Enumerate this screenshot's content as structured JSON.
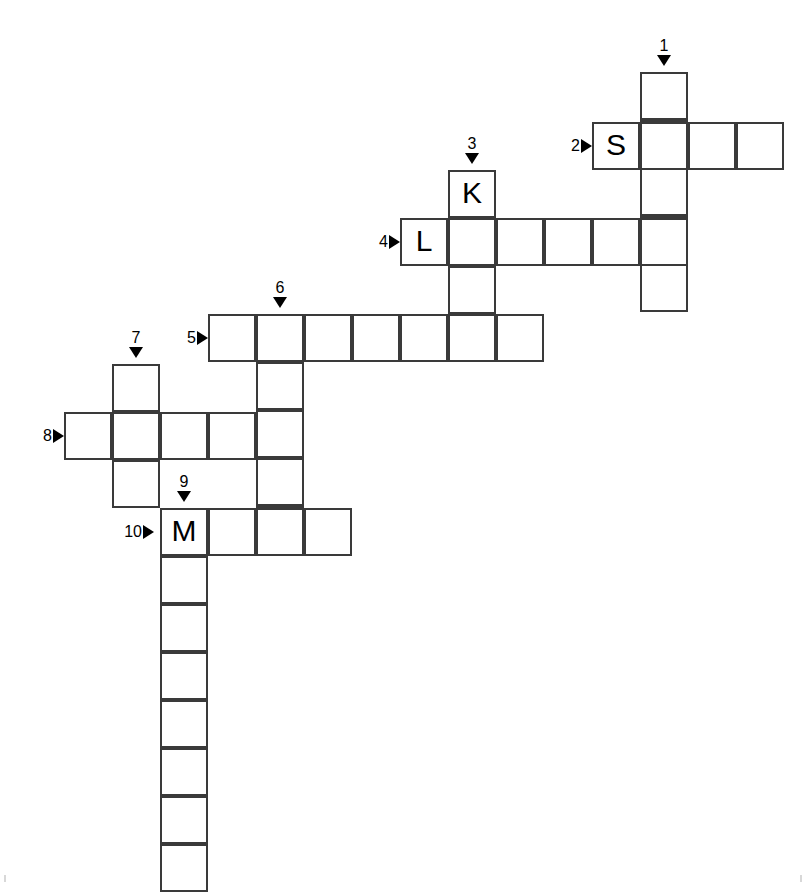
{
  "puzzle": {
    "title": "Crossword puzzle grid",
    "cell_size": 48,
    "border_color": "#3a3a3a",
    "background_color": "#ffffff",
    "letter_color": "#000000",
    "clue_label_color": "#000000",
    "entries": [
      {
        "number": "1",
        "direction": "down",
        "length": 5,
        "start": {
          "x": 640,
          "y": 72
        },
        "marker": {
          "x": 640,
          "y": 31
        },
        "letters": [
          "",
          "",
          "",
          "",
          ""
        ]
      },
      {
        "number": "2",
        "direction": "across",
        "length": 4,
        "start": {
          "x": 592,
          "y": 122
        },
        "marker": {
          "x": 553,
          "y": 122
        },
        "letters": [
          "S",
          "",
          "",
          ""
        ]
      },
      {
        "number": "3",
        "direction": "down",
        "length": 4,
        "start": {
          "x": 448,
          "y": 170
        },
        "marker": {
          "x": 448,
          "y": 129
        },
        "letters": [
          "K",
          "",
          "",
          ""
        ]
      },
      {
        "number": "4",
        "direction": "across",
        "length": 6,
        "start": {
          "x": 400,
          "y": 218
        },
        "marker": {
          "x": 361,
          "y": 218
        },
        "letters": [
          "L",
          "",
          "",
          "",
          "",
          ""
        ]
      },
      {
        "number": "5",
        "direction": "across",
        "length": 7,
        "start": {
          "x": 208,
          "y": 314
        },
        "marker": {
          "x": 169,
          "y": 314
        },
        "letters": [
          "",
          "",
          "",
          "",
          "",
          "",
          ""
        ]
      },
      {
        "number": "6",
        "direction": "down",
        "length": 5,
        "start": {
          "x": 256,
          "y": 314
        },
        "marker": {
          "x": 256,
          "y": 273
        },
        "letters": [
          "",
          "",
          "",
          "",
          ""
        ]
      },
      {
        "number": "7",
        "direction": "down",
        "length": 3,
        "start": {
          "x": 112,
          "y": 364
        },
        "marker": {
          "x": 112,
          "y": 323
        },
        "letters": [
          "",
          "",
          ""
        ]
      },
      {
        "number": "8",
        "direction": "across",
        "length": 4,
        "start": {
          "x": 64,
          "y": 412
        },
        "marker": {
          "x": 25,
          "y": 412
        },
        "letters": [
          "",
          "",
          "",
          ""
        ]
      },
      {
        "number": "9",
        "direction": "down",
        "length": 8,
        "start": {
          "x": 160,
          "y": 508
        },
        "marker": {
          "x": 160,
          "y": 467
        },
        "letters": [
          "M",
          "",
          "",
          "",
          "",
          "",
          "",
          ""
        ]
      },
      {
        "number": "10",
        "direction": "across",
        "length": 4,
        "start": {
          "x": 160,
          "y": 508
        },
        "marker": {
          "x": 115,
          "y": 508
        },
        "letters": [
          "M",
          "",
          "",
          ""
        ]
      }
    ],
    "filled_letters": [
      "S",
      "K",
      "L",
      "M"
    ]
  }
}
